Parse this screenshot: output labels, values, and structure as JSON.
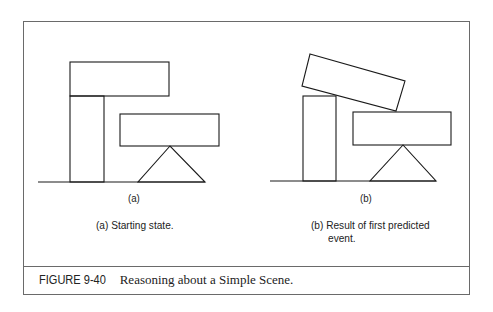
{
  "figure": {
    "number": "FIGURE 9-40",
    "title": "Reasoning about a Simple Scene."
  },
  "panels": [
    {
      "id": "a",
      "label": "(a)",
      "caption_lines": [
        "(a) Starting state."
      ]
    },
    {
      "id": "b",
      "label": "(b)",
      "caption_lines": [
        "(b) Result of first predicted",
        "event."
      ]
    }
  ],
  "colors": {
    "line": "#1a1a1a",
    "frame": "#6a6a6a",
    "background": "#ffffff"
  }
}
